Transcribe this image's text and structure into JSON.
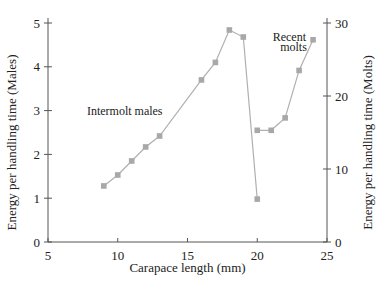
{
  "chart_data": {
    "type": "line",
    "title": "",
    "xlabel": "Carapace length (mm)",
    "ylabel_left": "Energy per handling time (Males)",
    "ylabel_right": "Energy per handling time (Molts)",
    "xlim": [
      5,
      25
    ],
    "ylim_left": [
      0,
      5
    ],
    "ylim_right": [
      0,
      30
    ],
    "x_ticks": [
      5,
      10,
      15,
      20,
      25
    ],
    "y_ticks_left": [
      0,
      1,
      2,
      3,
      4,
      5
    ],
    "y_ticks_right": [
      0,
      10,
      20,
      30
    ],
    "grid": false,
    "marker": "square",
    "line_color": "#b0b0b0",
    "marker_color": "#a8a8a8",
    "series": [
      {
        "name": "Intermolt males",
        "axis": "left",
        "x": [
          9,
          10,
          11,
          12,
          13,
          16,
          17,
          18,
          19,
          20
        ],
        "y": [
          1.28,
          1.53,
          1.85,
          2.17,
          2.42,
          3.7,
          4.1,
          4.84,
          4.68,
          0.98
        ]
      },
      {
        "name": "Recent molts",
        "axis": "right",
        "x": [
          20,
          21,
          22,
          23,
          24
        ],
        "y": [
          15.3,
          15.3,
          17.0,
          23.5,
          27.7
        ]
      }
    ],
    "annotations": [
      {
        "text": "Intermolt males",
        "x": 10.5,
        "y": 2.9
      },
      {
        "text": "Recent",
        "x": 22.3,
        "y": 4.6
      },
      {
        "text": "molts",
        "x": 22.6,
        "y": 4.35
      }
    ]
  }
}
